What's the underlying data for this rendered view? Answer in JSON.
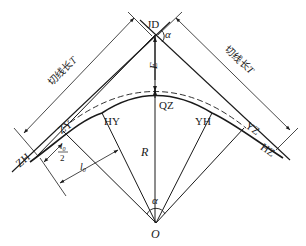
{
  "figure": {
    "background": "#ffffff",
    "line_color": "#1a1a1a"
  },
  "points": {
    "jd": "JD",
    "qz": "QZ",
    "zh": "ZH",
    "hz": "HZ",
    "zy": "ZY",
    "yz": "YZ",
    "hy": "HY",
    "yh": "YH",
    "o": "O"
  },
  "dimensions": {
    "tangent_length_left": "切线长",
    "tangent_length_right": "切线长",
    "tangent_symbol": "T",
    "external_distance": "E",
    "radius": "R",
    "deflection_angle_jd": "α",
    "central_angle_o": "α",
    "spiral_length": "l",
    "spiral_length_sub": "0",
    "half_spiral_num": "l",
    "half_spiral_sub": "0",
    "half_spiral_den": "2"
  }
}
